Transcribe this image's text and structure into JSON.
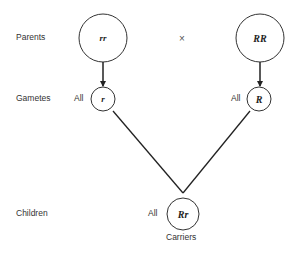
{
  "rows": {
    "parents": "Parents",
    "gametes": "Gametes",
    "children": "Children"
  },
  "cross_symbol": "×",
  "parents": [
    {
      "genotype": "rr"
    },
    {
      "genotype": "RR"
    }
  ],
  "gametes": [
    {
      "prefix": "All",
      "genotype": "r"
    },
    {
      "prefix": "All",
      "genotype": "R"
    }
  ],
  "children": {
    "prefix": "All",
    "genotype": "Rr",
    "caption": "Carriers"
  },
  "colors": {
    "stroke": "#222222",
    "text": "#333333",
    "background": "#ffffff"
  }
}
